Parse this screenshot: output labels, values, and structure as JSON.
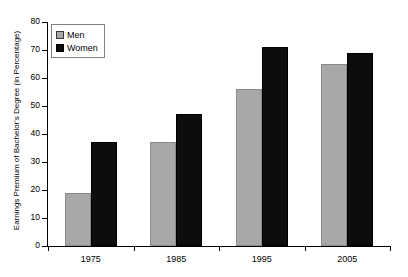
{
  "chart_data": {
    "type": "bar",
    "title": "",
    "xlabel": "",
    "ylabel": "Earnings Premium of Bachelor's Degree (in Percentage)",
    "categories": [
      "1975",
      "1985",
      "1995",
      "2005"
    ],
    "series": [
      {
        "name": "Men",
        "color": "#a8a8a8",
        "values": [
          19,
          37,
          56,
          65
        ]
      },
      {
        "name": "Women",
        "color": "#0d0d0d",
        "values": [
          37,
          47,
          71,
          69
        ]
      }
    ],
    "ylim": [
      0,
      80
    ],
    "ytick_step": 10,
    "yticks": [
      "0",
      "10",
      "20",
      "30",
      "40",
      "50",
      "60",
      "70",
      "80"
    ],
    "grid": false,
    "legend_position": "top-left",
    "legend_entries": [
      "Men",
      "Women"
    ]
  }
}
